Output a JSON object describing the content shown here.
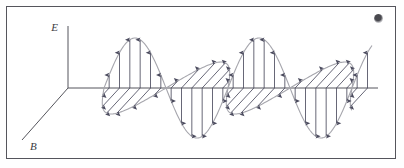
{
  "figure": {
    "type": "physics-diagram",
    "background_color": "#ffffff",
    "border_color": "#55555c",
    "axes": {
      "e_axis": {
        "label": "E",
        "orientation": "vertical",
        "color": "#55555c",
        "origin_x": 68,
        "origin_y": 88,
        "tip_y": 26
      },
      "b_axis": {
        "label": "B",
        "orientation": "diagonal-down-left",
        "color": "#55555c",
        "origin_x": 68,
        "origin_y": 88,
        "tip_x": 22,
        "tip_y": 140
      },
      "propagation_axis": {
        "label": "",
        "orientation": "horizontal",
        "color": "#55555c",
        "start_x": 68,
        "start_y": 88,
        "end_x": 378
      }
    },
    "wave": {
      "e_field_color": "#4b4b5e",
      "b_field_color": "#4b4b5e",
      "envelope_color": "#a6a6ad",
      "amplitude": 50,
      "wavelength": 124,
      "cycles": 2.5,
      "start_x": 104,
      "end_x": 372,
      "baseline_y": 88,
      "b_skew_x": -0.48,
      "b_skew_y": 0.52,
      "arrow_count_per_half_cycle": 6,
      "phase_relationship": "in-phase"
    },
    "marks": {
      "corner_smudge": {
        "name": "corner-artifact",
        "x": 374,
        "y": 14
      }
    }
  }
}
